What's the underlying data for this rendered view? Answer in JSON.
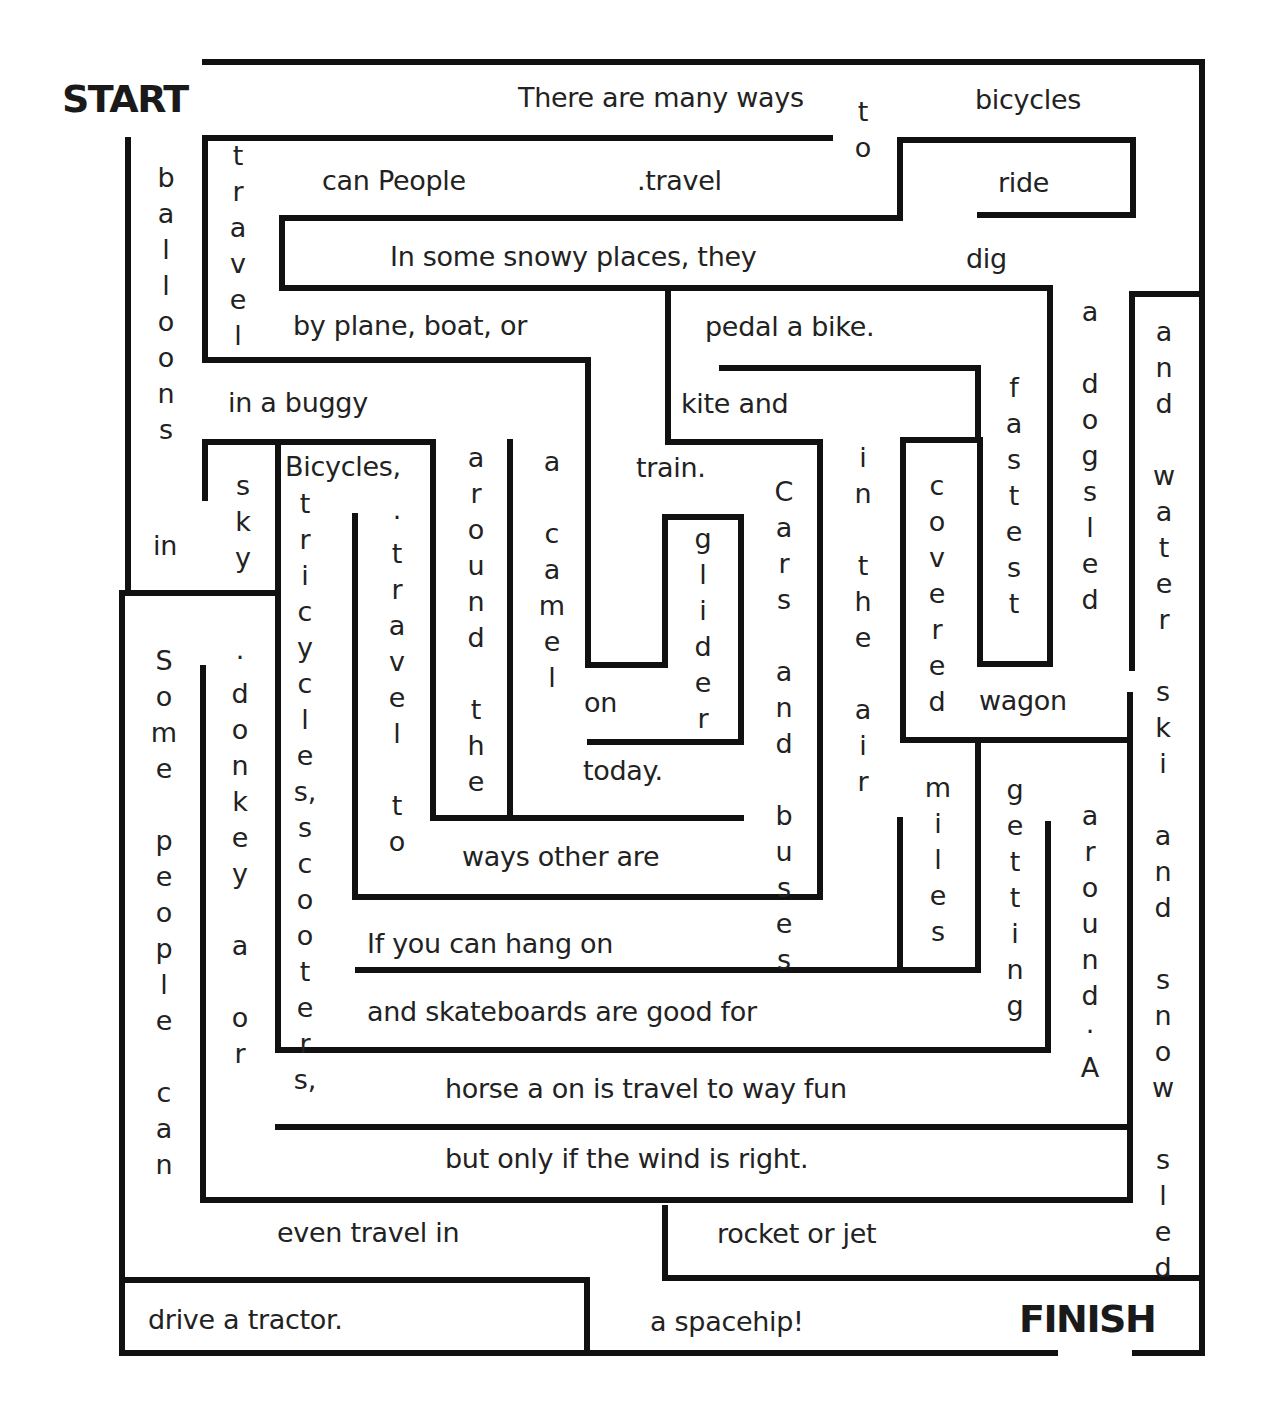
{
  "worksheet": {
    "start_label": "START",
    "finish_label": "FINISH",
    "wall_color": "#111111",
    "text_color": "#222222"
  },
  "horizontal_phrases": [
    {
      "id": "h01",
      "text": "There are many ways",
      "x": 518,
      "y": 84
    },
    {
      "id": "h02",
      "text": "bicycles",
      "x": 975,
      "y": 86
    },
    {
      "id": "h03",
      "text": "can People",
      "x": 322,
      "y": 167
    },
    {
      "id": "h04",
      "text": ".travel",
      "x": 637,
      "y": 167
    },
    {
      "id": "h05",
      "text": "ride",
      "x": 998,
      "y": 169
    },
    {
      "id": "h06",
      "text": "In some snowy places, they",
      "x": 390,
      "y": 243
    },
    {
      "id": "h07",
      "text": "dig",
      "x": 966,
      "y": 245
    },
    {
      "id": "h08",
      "text": "by plane, boat, or",
      "x": 293,
      "y": 312
    },
    {
      "id": "h09",
      "text": "pedal a bike.",
      "x": 705,
      "y": 313
    },
    {
      "id": "h10",
      "text": "in a buggy",
      "x": 228,
      "y": 389
    },
    {
      "id": "h11",
      "text": "kite and",
      "x": 681,
      "y": 390
    },
    {
      "id": "h12",
      "text": "Bicycles,",
      "x": 285,
      "y": 453
    },
    {
      "id": "h13",
      "text": "train.",
      "x": 636,
      "y": 454
    },
    {
      "id": "h14",
      "text": "in",
      "x": 153,
      "y": 532
    },
    {
      "id": "h15",
      "text": "on",
      "x": 584,
      "y": 689
    },
    {
      "id": "h16",
      "text": "wagon",
      "x": 979,
      "y": 687
    },
    {
      "id": "h17",
      "text": "today.",
      "x": 583,
      "y": 757
    },
    {
      "id": "h18",
      "text": "ways other are",
      "x": 462,
      "y": 843
    },
    {
      "id": "h19",
      "text": "If you can hang on",
      "x": 367,
      "y": 930
    },
    {
      "id": "h20",
      "text": "and skateboards are good for",
      "x": 367,
      "y": 998
    },
    {
      "id": "h21",
      "text": "horse a on is travel to way fun",
      "x": 445,
      "y": 1075
    },
    {
      "id": "h22",
      "text": "but only if the wind is right.",
      "x": 445,
      "y": 1145
    },
    {
      "id": "h23",
      "text": "even travel in",
      "x": 277,
      "y": 1219
    },
    {
      "id": "h24",
      "text": "rocket or jet",
      "x": 717,
      "y": 1220
    },
    {
      "id": "h25",
      "text": "drive a tractor.",
      "x": 148,
      "y": 1306
    },
    {
      "id": "h26",
      "text": "a spacehip!",
      "x": 650,
      "y": 1308
    }
  ],
  "vertical_words": [
    {
      "id": "v01",
      "text": "t\no",
      "x": 848,
      "y": 94
    },
    {
      "id": "v02",
      "text": "t\nr\na\nv\ne\nl",
      "x": 223,
      "y": 138
    },
    {
      "id": "v03",
      "text": "b\na\nl\nl\no\no\nn\ns",
      "x": 151,
      "y": 160
    },
    {
      "id": "v04",
      "text": "a",
      "x": 1075,
      "y": 294
    },
    {
      "id": "v05",
      "text": "a\nn\nd\n\nw\na\nt\ne\nr",
      "x": 1149,
      "y": 314
    },
    {
      "id": "v06",
      "text": "f\na\ns\nt\ne\ns\nt",
      "x": 999,
      "y": 370
    },
    {
      "id": "v07",
      "text": "d\no\ng\ns\nl\ne\nd",
      "x": 1075,
      "y": 366
    },
    {
      "id": "v08",
      "text": "i\nn\n\nt\nh\ne\n\na\ni\nr",
      "x": 848,
      "y": 440
    },
    {
      "id": "v09",
      "text": "a\nr\no\nu\nn\nd\n\nt\nh\ne",
      "x": 461,
      "y": 440
    },
    {
      "id": "v10",
      "text": "a\n\nc\na\nm\ne\nl",
      "x": 537,
      "y": 444
    },
    {
      "id": "v11",
      "text": "s\nk\ny",
      "x": 228,
      "y": 468
    },
    {
      "id": "v12",
      "text": "C\na\nr\ns\n\na\nn\nd\n\nb\nu\ns\ne\ns",
      "x": 769,
      "y": 474
    },
    {
      "id": "v13",
      "text": "c\no\nv\ne\nr\ne\nd",
      "x": 922,
      "y": 468
    },
    {
      "id": "v14",
      "text": "t\nr\ni\nc\ny\nc\nl\ne\ns,\ns\nc\no\no\nt\ne\nr\ns,",
      "x": 290,
      "y": 486
    },
    {
      "id": "v15",
      "text": "·\nt\nr\na\nv\ne\nl\n\nt\no",
      "x": 382,
      "y": 500
    },
    {
      "id": "v16",
      "text": "g\nl\ni\nd\ne\nr",
      "x": 688,
      "y": 521
    },
    {
      "id": "v17",
      "text": "S\no\nm\ne\n\np\ne\no\np\nl\ne\n\nc\na\nn",
      "x": 149,
      "y": 643
    },
    {
      "id": "v18",
      "text": "·\nd\no\nn\nk\ne\ny\n\na\n\no\nr",
      "x": 225,
      "y": 640
    },
    {
      "id": "v19",
      "text": "s\nk\ni\n\na\nn\nd\n\ns\nn\no\nw\n\ns\nl\ne\nd",
      "x": 1148,
      "y": 674
    },
    {
      "id": "v20",
      "text": "m\ni\nl\ne\ns",
      "x": 923,
      "y": 770
    },
    {
      "id": "v21",
      "text": "g\ne\nt\nt\ni\nn\ng",
      "x": 1000,
      "y": 772
    },
    {
      "id": "v22",
      "text": "a\nr\no\nu\nn\nd\n·\nA",
      "x": 1075,
      "y": 798
    }
  ]
}
